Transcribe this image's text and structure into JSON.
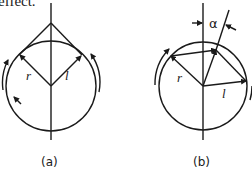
{
  "caption_fragment": "effect.",
  "figure": {
    "panels": [
      {
        "id": "a",
        "label": "(a)",
        "radius_label": "r",
        "length_label": "l"
      },
      {
        "id": "b",
        "label": "(b)",
        "radius_label": "r",
        "length_label": "l",
        "angle_label": "α"
      }
    ]
  },
  "colors": {
    "stroke": "#1a1a1a",
    "background": "#ffffff"
  }
}
